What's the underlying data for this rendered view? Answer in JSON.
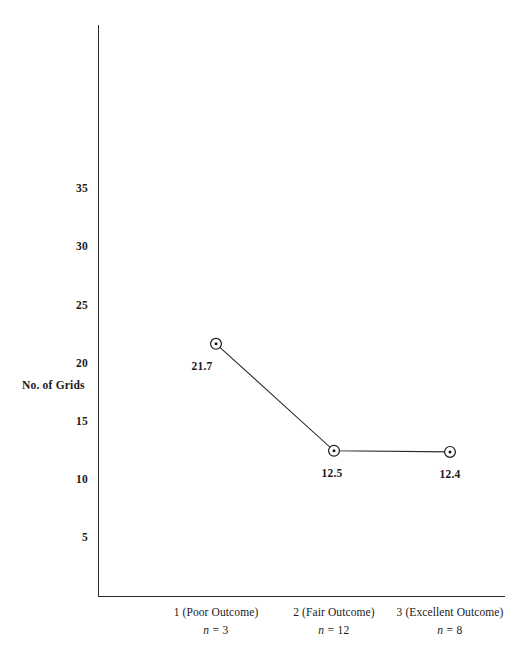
{
  "chart_data": {
    "type": "line",
    "title": "",
    "xlabel": "",
    "ylabel": "No. of Grids",
    "categories": [
      "1 (Poor Outcome)",
      "2 (Fair Outcome)",
      "3 (Excellent Outcome)"
    ],
    "group_sizes": [
      "n = 3",
      "n = 12",
      "n = 8"
    ],
    "values": [
      21.7,
      12.5,
      12.4
    ],
    "point_labels": [
      "21.7",
      "12.5",
      "12.4"
    ],
    "yticks": [
      5,
      10,
      15,
      20,
      25,
      30,
      35
    ],
    "ytick_labels": [
      "5",
      "10",
      "15",
      "20",
      "25",
      "30",
      "35"
    ],
    "ylim": [
      0,
      40
    ],
    "grid": false,
    "legend": false,
    "marker": "circle-with-center-dot",
    "line_color": "#2b2b2b",
    "marker_color": "#1a1a1a",
    "background_color": "#ffffff"
  },
  "axis": {
    "y_title": "No. of Grids"
  },
  "categories": [
    {
      "name": "1 (Poor Outcome)",
      "n_prefix": "n",
      "n_value": "= 3"
    },
    {
      "name": "2 (Fair Outcome)",
      "n_prefix": "n",
      "n_value": "= 12"
    },
    {
      "name": "3 (Excellent Outcome)",
      "n_prefix": "n",
      "n_value": "= 8"
    }
  ]
}
